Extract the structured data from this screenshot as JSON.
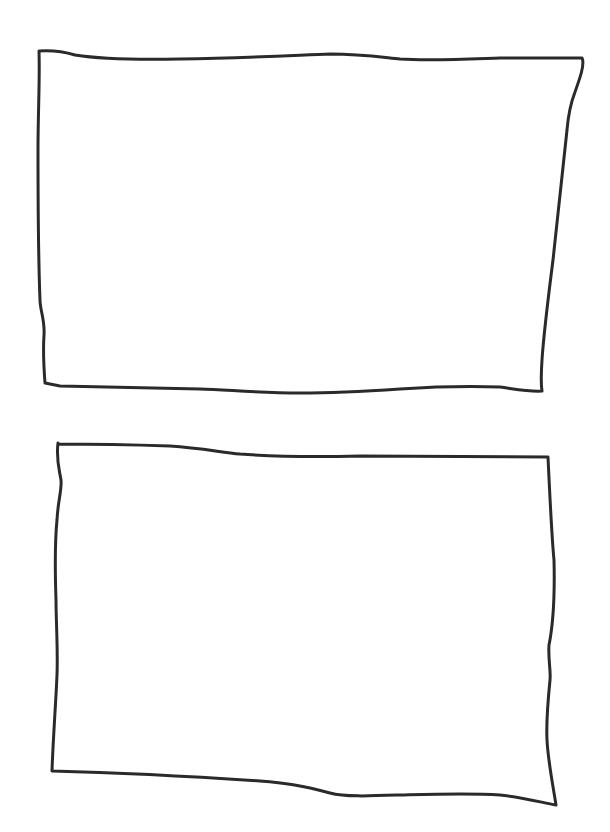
{
  "canvas": {
    "width": 610,
    "height": 832,
    "background": "#ffffff",
    "stroke_color": "#2a2a2a"
  },
  "shapes": [
    {
      "type": "hand-drawn-rectangle",
      "label": "",
      "approx_bounds": {
        "x": 39,
        "y": 51,
        "w": 543,
        "h": 340
      }
    },
    {
      "type": "hand-drawn-rectangle",
      "label": "",
      "approx_bounds": {
        "x": 52,
        "y": 443,
        "w": 504,
        "h": 362
      }
    }
  ]
}
